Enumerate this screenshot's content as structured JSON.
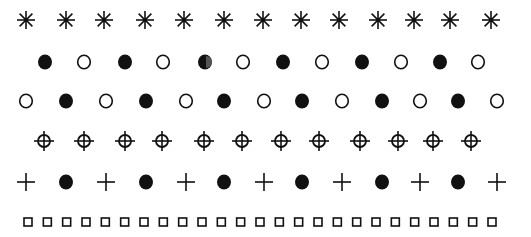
{
  "figure": {
    "ink_color": "#111111",
    "background": "#ffffff",
    "rows": [
      {
        "name": "asterisk-row",
        "y": 20,
        "symbols": [
          "asterisk",
          "asterisk",
          "asterisk",
          "asterisk",
          "asterisk",
          "asterisk",
          "asterisk",
          "asterisk",
          "asterisk",
          "asterisk",
          "asterisk",
          "asterisk",
          "asterisk"
        ],
        "x": [
          26,
          66,
          104,
          145,
          184,
          224,
          263,
          301,
          339,
          378,
          414,
          450,
          491
        ]
      },
      {
        "name": "filled-open-circle-row",
        "y": 62,
        "symbols": [
          "filled-circle",
          "open-circle",
          "filled-circle",
          "open-circle",
          "half-circle",
          "open-circle",
          "filled-circle",
          "open-circle",
          "filled-circle",
          "open-circle",
          "filled-circle",
          "open-circle"
        ],
        "x": [
          45,
          84,
          125,
          163,
          205,
          243,
          283,
          322,
          362,
          401,
          440,
          478
        ]
      },
      {
        "name": "open-filled-circle-row",
        "y": 101,
        "symbols": [
          "open-circle",
          "filled-circle",
          "open-circle",
          "filled-circle",
          "open-circle",
          "filled-circle",
          "open-circle",
          "filled-circle",
          "open-circle",
          "filled-circle",
          "open-circle",
          "filled-circle",
          "open-circle"
        ],
        "x": [
          26,
          66,
          106,
          146,
          186,
          224,
          264,
          302,
          342,
          382,
          420,
          458,
          497
        ]
      },
      {
        "name": "crosshair-row",
        "y": 141,
        "symbols": [
          "crosshair",
          "crosshair",
          "crosshair",
          "crosshair",
          "crosshair",
          "crosshair",
          "crosshair",
          "crosshair",
          "crosshair",
          "crosshair",
          "crosshair",
          "crosshair"
        ],
        "x": [
          44,
          84,
          125,
          162,
          204,
          242,
          281,
          319,
          360,
          398,
          433,
          471
        ]
      },
      {
        "name": "plus-dot-row",
        "y": 182,
        "symbols": [
          "plus",
          "filled-circle",
          "plus",
          "filled-circle",
          "plus",
          "filled-circle",
          "plus",
          "filled-circle",
          "plus",
          "filled-circle",
          "plus",
          "filled-circle",
          "plus"
        ],
        "x": [
          26,
          66,
          106,
          146,
          186,
          224,
          264,
          302,
          342,
          382,
          420,
          458,
          497
        ]
      },
      {
        "name": "square-row",
        "y": 222,
        "symbols": [
          "open-square",
          "open-square",
          "open-square",
          "open-square",
          "open-square",
          "open-square",
          "open-square",
          "open-square",
          "open-square",
          "open-square",
          "open-square",
          "open-square",
          "open-square",
          "open-square",
          "open-square",
          "open-square",
          "open-square",
          "open-square",
          "open-square",
          "open-square",
          "open-square",
          "open-square",
          "open-square",
          "open-square",
          "open-square"
        ],
        "x": [
          28,
          47,
          66,
          85,
          104,
          125,
          144,
          163,
          183,
          203,
          223,
          243,
          262,
          283,
          303,
          323,
          343,
          363,
          384,
          404,
          424,
          444,
          464,
          472,
          492
        ]
      }
    ]
  }
}
